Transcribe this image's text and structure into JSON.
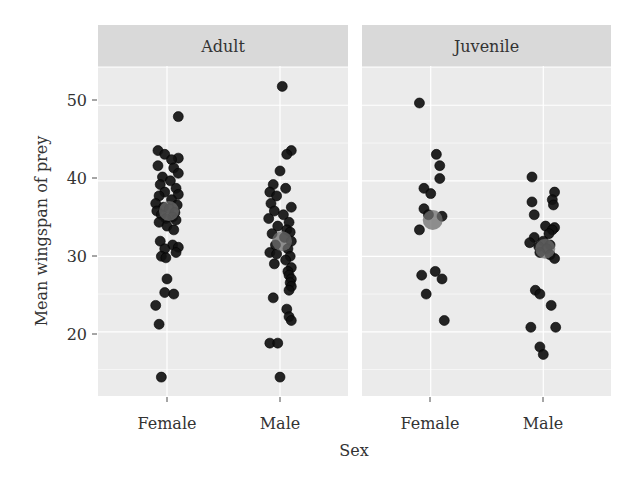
{
  "chart_data": {
    "type": "scatter",
    "subtype": "faceted jitter plot with group means",
    "title": "",
    "xlabel": "Sex",
    "ylabel": "Mean wingspan of prey",
    "ylim": [
      11.5,
      55.2
    ],
    "yticks": [
      20,
      30,
      40,
      50
    ],
    "categories": [
      "Female",
      "Male"
    ],
    "grid": true,
    "legend": "none",
    "facets": [
      {
        "label": "Adult",
        "series": [
          {
            "name": "Female",
            "mean": 36.0,
            "values": [
              48.5,
              44.0,
              43.5,
              43.0,
              42.8,
              42.0,
              41.7,
              41.0,
              40.5,
              40.0,
              39.5,
              39.0,
              38.5,
              38.2,
              38.0,
              37.5,
              37.0,
              36.8,
              36.5,
              36.3,
              36.0,
              35.8,
              35.5,
              35.2,
              35.0,
              34.8,
              34.5,
              34.0,
              33.5,
              32.0,
              31.5,
              31.2,
              31.0,
              30.5,
              30.0,
              29.8,
              27.0,
              25.2,
              25.0,
              23.5,
              21.0,
              14.0
            ],
            "jitter": [
              0.1,
              -0.08,
              -0.02,
              0.1,
              0.04,
              -0.08,
              0.06,
              0.1,
              -0.04,
              0.03,
              -0.06,
              0.08,
              -0.02,
              0.1,
              -0.07,
              0.04,
              -0.1,
              0.09,
              -0.03,
              0.02,
              -0.09,
              0.07,
              -0.05,
              0.05,
              -0.01,
              0.08,
              -0.07,
              0.0,
              0.06,
              -0.06,
              0.05,
              0.1,
              -0.02,
              0.08,
              -0.05,
              -0.01,
              0.0,
              -0.02,
              0.06,
              -0.1,
              -0.07,
              -0.05
            ]
          },
          {
            "name": "Male",
            "mean": 32.0,
            "values": [
              52.5,
              44.0,
              43.5,
              41.3,
              39.5,
              39.0,
              38.5,
              38.0,
              37.0,
              36.5,
              36.0,
              35.5,
              35.0,
              34.5,
              34.0,
              33.5,
              33.2,
              33.0,
              32.5,
              32.0,
              31.5,
              31.0,
              30.5,
              30.3,
              30.0,
              29.5,
              29.0,
              28.5,
              28.0,
              27.5,
              27.0,
              26.5,
              26.0,
              25.5,
              24.5,
              23.0,
              22.0,
              21.5,
              18.5,
              18.5,
              14.0
            ],
            "jitter": [
              0.02,
              0.1,
              0.06,
              0.0,
              -0.06,
              0.05,
              -0.09,
              -0.03,
              -0.08,
              0.1,
              -0.05,
              0.03,
              -0.1,
              0.08,
              -0.02,
              0.06,
              0.09,
              -0.07,
              0.04,
              0.1,
              -0.04,
              0.07,
              -0.09,
              -0.03,
              0.09,
              0.05,
              -0.05,
              0.1,
              0.07,
              0.08,
              0.1,
              0.09,
              0.1,
              0.08,
              -0.06,
              0.06,
              0.08,
              0.1,
              -0.09,
              -0.02,
              0.0
            ]
          }
        ]
      },
      {
        "label": "Juvenile",
        "series": [
          {
            "name": "Female",
            "mean": 34.8,
            "values": [
              50.3,
              43.5,
              42.0,
              40.3,
              39.0,
              38.3,
              36.3,
              35.5,
              35.3,
              33.5,
              28.0,
              27.5,
              27.0,
              25.0,
              21.5
            ],
            "jitter": [
              -0.1,
              0.05,
              0.08,
              0.08,
              -0.06,
              0.0,
              -0.06,
              -0.02,
              0.1,
              -0.1,
              0.04,
              -0.08,
              0.1,
              -0.04,
              0.12
            ]
          },
          {
            "name": "Male",
            "mean": 31.0,
            "values": [
              40.5,
              38.5,
              37.5,
              37.2,
              36.8,
              35.5,
              34.0,
              33.8,
              33.5,
              33.0,
              32.5,
              32.0,
              31.8,
              31.5,
              31.3,
              31.0,
              30.5,
              30.2,
              29.7,
              25.5,
              25.0,
              23.5,
              20.6,
              20.6,
              18.0,
              17.0
            ],
            "jitter": [
              -0.1,
              0.1,
              0.08,
              -0.1,
              0.09,
              -0.08,
              0.02,
              0.1,
              0.08,
              0.05,
              -0.08,
              0.0,
              -0.12,
              0.06,
              -0.04,
              0.03,
              -0.03,
              0.06,
              0.1,
              -0.07,
              -0.03,
              0.07,
              -0.11,
              0.11,
              -0.03,
              0.0
            ]
          }
        ]
      }
    ]
  },
  "style": {
    "panel_bg": "#ebebeb",
    "strip_bg": "#d9d9d9",
    "grid_color": "#ffffff",
    "point_color": "#111111",
    "point_edge": "#000000",
    "mean_color": "#6e6e6e",
    "text_color": "#333333",
    "tick_color": "#4d4d4d"
  },
  "labels": {
    "xlabel": "Sex",
    "ylabel": "Mean wingspan of prey",
    "facet_1": "Adult",
    "facet_2": "Juvenile",
    "x_tick_female": "Female",
    "x_tick_male": "Male",
    "y_ticks": [
      "50",
      "40",
      "30",
      "20"
    ]
  }
}
